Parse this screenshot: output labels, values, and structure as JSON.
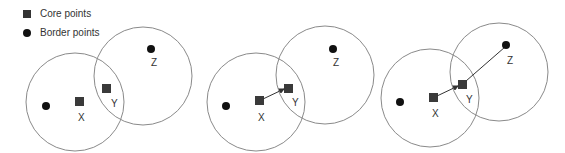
{
  "legend": {
    "core_label": "Core points",
    "border_label": "Border points"
  },
  "colors": {
    "circle_stroke": "#8a8a8a",
    "core_fill": "#3a3a3a",
    "border_fill": "#111111",
    "arrow": "#333333"
  },
  "panels": [
    {
      "labels": {
        "x": "X",
        "y": "Y",
        "z": "Z"
      },
      "arrows": "none"
    },
    {
      "labels": {
        "x": "X",
        "y": "Y",
        "z": "Z"
      },
      "arrows": "X→Y"
    },
    {
      "labels": {
        "x": "X",
        "y": "Y",
        "z": "Z"
      },
      "arrows": "X→Y→Z"
    }
  ]
}
